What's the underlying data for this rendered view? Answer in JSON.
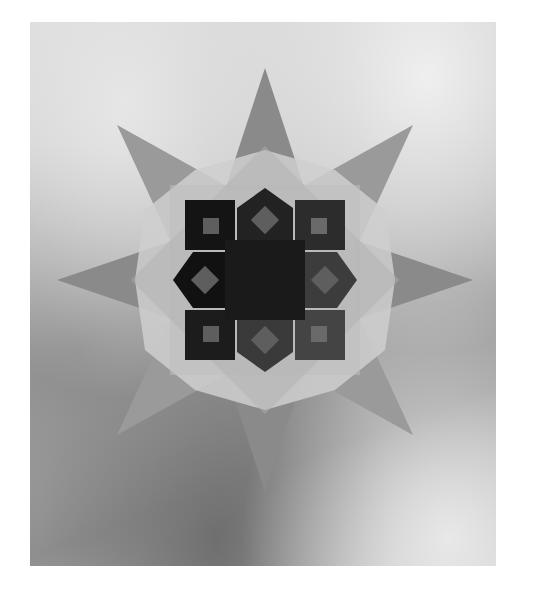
{
  "image": {
    "description": "Grayscale photograph of an eight-pointed translucent paper window star on textured glass",
    "subject": "eight-pointed paper star",
    "background": "textured frosted glass",
    "colors": {
      "page_background": "#ffffff",
      "outer_points": "#8c8c8c",
      "mid_layer": "#c8c8c8",
      "inner_rosette": "#1e1e1e",
      "diamond_accents": "#5a5a5a"
    }
  }
}
